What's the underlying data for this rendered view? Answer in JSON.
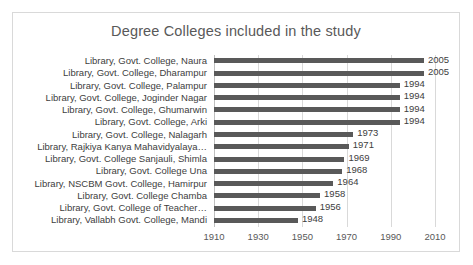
{
  "chart_data": {
    "type": "bar",
    "orientation": "horizontal",
    "title": "Degree Colleges included in the study",
    "xlabel": "",
    "ylabel": "",
    "xlim": [
      1910,
      2010
    ],
    "xticks": [
      1910,
      1930,
      1950,
      1970,
      1990,
      2010
    ],
    "grid": true,
    "legend": false,
    "data_labels": true,
    "bar_color": "#595959",
    "gridline_color": "#d9d9d9",
    "text_color": "#404040",
    "title_color": "#595959",
    "categories": [
      "Library, Govt. College, Naura",
      "Library, Govt. College, Dharampur",
      "Library, Govt. College, Palampur",
      "Library, Govt. College, Joginder Nagar",
      "Library, Govt. College, Ghumarwin",
      "Library, Govt. College, Arki",
      "Library, Govt. College, Nalagarh",
      "Library, Rajkiya Kanya Mahavidyalaya…",
      "Library, Govt. College Sanjauli, Shimla",
      "Library, Govt. College Una",
      "Library, NSCBM Govt. College, Hamirpur",
      "Library, Govt. College Chamba",
      "Library, Govt. College of Teacher…",
      "Library, Vallabh Govt. College, Mandi"
    ],
    "values": [
      2005,
      2005,
      1994,
      1994,
      1994,
      1994,
      1973,
      1971,
      1969,
      1968,
      1964,
      1958,
      1956,
      1948
    ],
    "value_labels": [
      "2005",
      "2005",
      "1994",
      "1994",
      "1994",
      "1994",
      "1973",
      "1971",
      "1969",
      "1968",
      "1964",
      "1958",
      "1956",
      "1948"
    ],
    "xtick_labels": [
      "1910",
      "1930",
      "1950",
      "1970",
      "1990",
      "2010"
    ]
  }
}
